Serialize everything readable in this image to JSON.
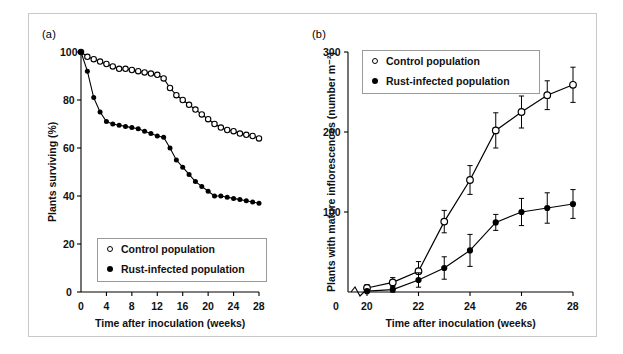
{
  "figure": {
    "panel_a_tag": "(a)",
    "panel_b_tag": "(b)",
    "legend_control": "Control population",
    "legend_infected": "Rust-infected population"
  },
  "chart_data": [
    {
      "type": "line",
      "panel": "(a)",
      "title": "",
      "xlabel": "Time after inoculation (weeks)",
      "ylabel": "Plants surviving (%)",
      "xlim": [
        0,
        28
      ],
      "ylim": [
        0,
        100
      ],
      "xticks": [
        0,
        4,
        8,
        12,
        16,
        20,
        24,
        28
      ],
      "yticks": [
        0,
        20,
        40,
        60,
        80,
        100
      ],
      "grid": false,
      "legend_position": "bottom-left",
      "series": [
        {
          "name": "Control population",
          "marker": "open-circle",
          "x": [
            0,
            1,
            2,
            3,
            4,
            5,
            6,
            7,
            8,
            9,
            10,
            11,
            12,
            13,
            14,
            15,
            16,
            17,
            18,
            19,
            20,
            21,
            22,
            23,
            24,
            25,
            26,
            27,
            28
          ],
          "values": [
            100,
            98,
            97,
            96,
            95,
            94,
            93,
            93,
            92.5,
            92,
            91.5,
            91,
            90.5,
            89,
            85,
            82,
            80,
            78,
            76,
            74,
            72,
            70,
            68.5,
            67.5,
            67,
            66,
            65.5,
            65,
            64
          ]
        },
        {
          "name": "Rust-infected population",
          "marker": "filled-circle",
          "x": [
            0,
            1,
            2,
            3,
            4,
            5,
            6,
            7,
            8,
            9,
            10,
            11,
            12,
            13,
            14,
            15,
            16,
            17,
            18,
            19,
            20,
            21,
            22,
            23,
            24,
            25,
            26,
            27,
            28
          ],
          "values": [
            100,
            92,
            81,
            75,
            71,
            70,
            69.5,
            69,
            68.5,
            68,
            67,
            66,
            65,
            64.5,
            60,
            55,
            52,
            49,
            46,
            44,
            42,
            40,
            40,
            39.5,
            39,
            38.5,
            38,
            37.5,
            37
          ]
        }
      ]
    },
    {
      "type": "line",
      "panel": "(b)",
      "title": "",
      "xlabel": "Time after inoculation (weeks)",
      "ylabel": "Plants with mature inflorescences (number m⁻²)",
      "xlim": [
        20,
        28
      ],
      "ylim": [
        0,
        300
      ],
      "xticks": [
        20,
        22,
        24,
        26,
        28
      ],
      "yticks": [
        0,
        100,
        200,
        300
      ],
      "x_origin_label": "0",
      "axis_break": true,
      "grid": false,
      "legend_position": "top-left",
      "error_bars": "standard error",
      "series": [
        {
          "name": "Control population",
          "marker": "open-circle",
          "x": [
            20,
            21,
            22,
            23,
            24,
            25,
            26,
            27,
            28
          ],
          "values": [
            5,
            12,
            26,
            88,
            140,
            202,
            225,
            246,
            259
          ],
          "errors": [
            4,
            6,
            12,
            14,
            18,
            22,
            20,
            18,
            22
          ]
        },
        {
          "name": "Rust-infected population",
          "marker": "filled-circle",
          "x": [
            20,
            21,
            22,
            23,
            24,
            25,
            26,
            27,
            28
          ],
          "values": [
            1,
            3,
            15,
            30,
            52,
            87,
            100,
            105,
            110
          ],
          "errors": [
            2,
            4,
            9,
            14,
            20,
            10,
            17,
            19,
            18
          ]
        }
      ]
    }
  ]
}
